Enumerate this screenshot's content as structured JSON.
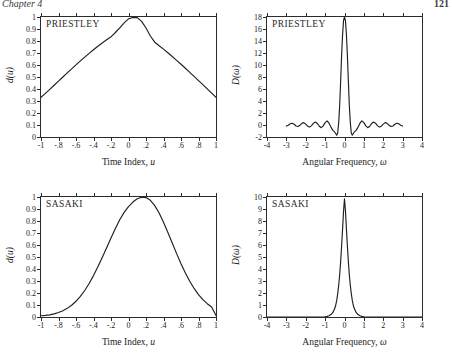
{
  "header": {
    "left": "Chapter 4",
    "right": "121"
  },
  "panels": [
    {
      "id": "priestley-lag",
      "tag": "PRIESTLEY",
      "xlabel_text": "Time Index, ",
      "xlabel_sym": "u",
      "ylabel_text": "d(u)",
      "yticks": [
        "0",
        "0.1",
        "0.2",
        "0.3",
        "0.4",
        "0.5",
        "0.6",
        "0.7",
        "0.8",
        "0.9",
        "1"
      ],
      "xticks": [
        "-1",
        "-.8",
        "-.6",
        "-.4",
        "-.2",
        "0",
        ".2",
        ".4",
        ".6",
        ".8",
        "1"
      ]
    },
    {
      "id": "priestley-spectral",
      "tag": "PRIESTLEY",
      "xlabel_text": "Angular Frequency, ",
      "xlabel_sym": "ω",
      "ylabel_text": "D(ω)",
      "yticks": [
        "-2",
        "0",
        "2",
        "4",
        "6",
        "8",
        "10",
        "12",
        "14",
        "16",
        "18"
      ],
      "xticks": [
        "-4",
        "-3",
        "-2",
        "-1",
        "0",
        "1",
        "2",
        "3",
        "4"
      ]
    },
    {
      "id": "sasaki-lag",
      "tag": "SASAKI",
      "xlabel_text": "Time Index, ",
      "xlabel_sym": "u",
      "ylabel_text": "d(u)",
      "yticks": [
        "0",
        "0.1",
        "0.2",
        "0.3",
        "0.4",
        "0.5",
        "0.6",
        "0.7",
        "0.8",
        "0.9",
        "1"
      ],
      "xticks": [
        "-1",
        "-.8",
        "-.6",
        "-.4",
        "-.2",
        "0",
        ".2",
        ".4",
        ".6",
        ".8",
        "1"
      ]
    },
    {
      "id": "sasaki-spectral",
      "tag": "SASAKI",
      "xlabel_text": "Angular Frequency, ",
      "xlabel_sym": "ω",
      "ylabel_text": "D(ω)",
      "yticks": [
        "0",
        "1",
        "2",
        "3",
        "4",
        "5",
        "6",
        "7",
        "8",
        "9",
        "10"
      ],
      "xticks": [
        "-4",
        "-3",
        "-2",
        "-1",
        "0",
        "1",
        "2",
        "3",
        "4"
      ]
    }
  ],
  "chart_data": [
    {
      "type": "line",
      "id": "priestley-lag",
      "title": "PRIESTLEY",
      "xlabel": "Time Index, u",
      "ylabel": "d(u)",
      "xlim": [
        -1,
        1
      ],
      "ylim": [
        0,
        1
      ],
      "grid": false,
      "legend": "none",
      "x": [
        -1.0,
        -0.95,
        -0.9,
        -0.85,
        -0.8,
        -0.75,
        -0.7,
        -0.65,
        -0.6,
        -0.55,
        -0.5,
        -0.45,
        -0.4,
        -0.35,
        -0.3,
        -0.25,
        -0.2,
        -0.15,
        -0.1,
        -0.05,
        0.0,
        0.05,
        0.1,
        0.15,
        0.2,
        0.25,
        0.3,
        0.35,
        0.4,
        0.45,
        0.5,
        0.55,
        0.6,
        0.65,
        0.7,
        0.75,
        0.8,
        0.85,
        0.9,
        0.95,
        1.0
      ],
      "y": [
        0.33,
        0.363,
        0.397,
        0.431,
        0.465,
        0.5,
        0.534,
        0.568,
        0.601,
        0.634,
        0.666,
        0.697,
        0.727,
        0.756,
        0.784,
        0.81,
        0.835,
        0.871,
        0.909,
        0.951,
        0.985,
        0.996,
        0.995,
        0.963,
        0.908,
        0.842,
        0.79,
        0.761,
        0.732,
        0.702,
        0.671,
        0.639,
        0.606,
        0.573,
        0.539,
        0.505,
        0.47,
        0.436,
        0.401,
        0.366,
        0.331
      ]
    },
    {
      "type": "line",
      "id": "priestley-spectral",
      "title": "PRIESTLEY",
      "xlabel": "Angular Frequency, ω",
      "ylabel": "D(ω)",
      "xlim": [
        -4,
        4
      ],
      "ylim": [
        -2,
        18
      ],
      "grid": false,
      "legend": "none",
      "peak_value": 18,
      "min_sidelobe": -1.7,
      "x": [
        -3.0,
        -2.9,
        -2.8,
        -2.7,
        -2.6,
        -2.5,
        -2.4,
        -2.3,
        -2.2,
        -2.1,
        -2.0,
        -1.9,
        -1.8,
        -1.7,
        -1.6,
        -1.5,
        -1.4,
        -1.3,
        -1.2,
        -1.1,
        -1.0,
        -0.9,
        -0.8,
        -0.7,
        -0.6,
        -0.5,
        -0.45,
        -0.4,
        -0.35,
        -0.3,
        -0.25,
        -0.2,
        -0.15,
        -0.1,
        -0.05,
        0.0,
        0.05,
        0.1,
        0.15,
        0.2,
        0.25,
        0.3,
        0.35,
        0.4,
        0.45,
        0.5,
        0.6,
        0.7,
        0.8,
        0.9,
        1.0,
        1.1,
        1.2,
        1.3,
        1.4,
        1.5,
        1.6,
        1.7,
        1.8,
        1.9,
        2.0,
        2.1,
        2.2,
        2.3,
        2.4,
        2.5,
        2.6,
        2.7,
        2.8,
        2.9,
        3.0
      ],
      "y": [
        -0.18,
        -0.05,
        0.2,
        0.3,
        0.12,
        -0.16,
        -0.25,
        -0.05,
        0.28,
        0.4,
        0.15,
        -0.2,
        -0.35,
        -0.1,
        0.3,
        0.5,
        0.25,
        -0.2,
        -0.45,
        -0.15,
        0.4,
        0.7,
        0.3,
        -0.35,
        -0.9,
        -1.2,
        -1.45,
        -1.7,
        -1.3,
        0.4,
        3.2,
        7.2,
        11.5,
        15.0,
        17.4,
        18.0,
        17.4,
        15.0,
        11.5,
        7.2,
        3.2,
        0.4,
        -1.3,
        -1.7,
        -1.45,
        -1.2,
        -0.9,
        -0.35,
        0.3,
        0.7,
        0.4,
        -0.15,
        -0.45,
        -0.2,
        0.25,
        0.5,
        0.3,
        -0.1,
        -0.35,
        -0.2,
        0.15,
        0.4,
        0.28,
        -0.05,
        -0.25,
        -0.16,
        0.12,
        0.3,
        0.2,
        -0.05,
        -0.18
      ]
    },
    {
      "type": "line",
      "id": "sasaki-lag",
      "title": "SASAKI",
      "xlabel": "Time Index, u",
      "ylabel": "d(u)",
      "xlim": [
        -1,
        1
      ],
      "ylim": [
        0,
        1
      ],
      "grid": false,
      "legend": "none",
      "x": [
        -1.0,
        -0.95,
        -0.9,
        -0.85,
        -0.8,
        -0.75,
        -0.7,
        -0.65,
        -0.6,
        -0.55,
        -0.5,
        -0.45,
        -0.4,
        -0.35,
        -0.3,
        -0.25,
        -0.2,
        -0.15,
        -0.1,
        -0.05,
        0.0,
        0.05,
        0.1,
        0.15,
        0.2,
        0.25,
        0.3,
        0.35,
        0.4,
        0.45,
        0.5,
        0.55,
        0.6,
        0.65,
        0.7,
        0.75,
        0.8,
        0.85,
        0.9,
        0.95,
        1.0
      ],
      "y": [
        0.01,
        0.013,
        0.018,
        0.026,
        0.037,
        0.052,
        0.072,
        0.098,
        0.131,
        0.172,
        0.221,
        0.279,
        0.345,
        0.418,
        0.496,
        0.577,
        0.658,
        0.737,
        0.81,
        0.872,
        0.92,
        0.958,
        0.985,
        0.998,
        0.995,
        0.972,
        0.928,
        0.866,
        0.79,
        0.705,
        0.616,
        0.528,
        0.444,
        0.367,
        0.298,
        0.238,
        0.187,
        0.145,
        0.111,
        0.084,
        0.012
      ]
    },
    {
      "type": "line",
      "id": "sasaki-spectral",
      "title": "SASAKI",
      "xlabel": "Angular Frequency, ω",
      "ylabel": "D(ω)",
      "xlim": [
        -4,
        4
      ],
      "ylim": [
        0,
        10
      ],
      "grid": false,
      "legend": "none",
      "peak_value": 9.85,
      "x": [
        -4.0,
        -2.0,
        -1.2,
        -1.0,
        -0.9,
        -0.8,
        -0.7,
        -0.6,
        -0.5,
        -0.45,
        -0.4,
        -0.35,
        -0.3,
        -0.25,
        -0.2,
        -0.15,
        -0.1,
        -0.05,
        0.0,
        0.05,
        0.1,
        0.15,
        0.2,
        0.25,
        0.3,
        0.35,
        0.4,
        0.45,
        0.5,
        0.6,
        0.7,
        0.8,
        0.9,
        1.0,
        1.2,
        2.0,
        4.0
      ],
      "y": [
        0.0,
        0.0,
        0.0,
        0.02,
        0.05,
        0.1,
        0.2,
        0.38,
        0.72,
        1.0,
        1.4,
        1.95,
        2.65,
        3.5,
        4.6,
        5.9,
        7.3,
        8.8,
        9.85,
        8.8,
        7.3,
        5.9,
        4.6,
        3.5,
        2.65,
        1.95,
        1.4,
        1.0,
        0.72,
        0.38,
        0.2,
        0.1,
        0.05,
        0.02,
        0.0,
        0.0,
        0.0
      ]
    }
  ]
}
